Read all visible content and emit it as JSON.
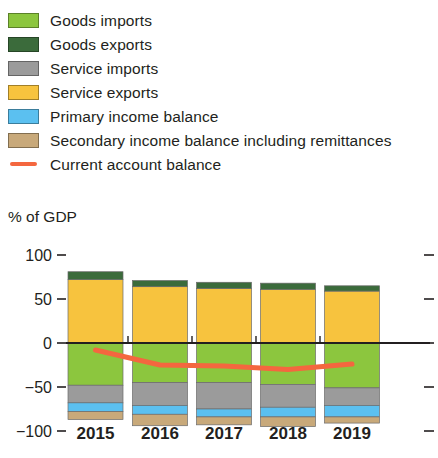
{
  "legend": {
    "items": [
      {
        "label": "Goods imports",
        "color": "#8cc63e",
        "type": "swatch",
        "name": "goods-imports"
      },
      {
        "label": "Goods exports",
        "color": "#3b6b3b",
        "type": "swatch",
        "name": "goods-exports"
      },
      {
        "label": "Service imports",
        "color": "#9b9b9b",
        "type": "swatch",
        "name": "service-imports"
      },
      {
        "label": "Service exports",
        "color": "#f7c33e",
        "type": "swatch",
        "name": "service-exports"
      },
      {
        "label": "Primary income balance",
        "color": "#5bc0f0",
        "type": "swatch",
        "name": "primary-income-balance"
      },
      {
        "label": "Secondary income balance including remittances",
        "color": "#c8a97a",
        "type": "swatch",
        "name": "secondary-income-balance"
      },
      {
        "label": "Current account balance",
        "color": "#f4673f",
        "type": "line",
        "name": "current-account-balance"
      }
    ]
  },
  "axis_title": "% of GDP",
  "chart_data": {
    "type": "bar",
    "title": "",
    "subtitle": "",
    "xlabel": "",
    "ylabel": "% of GDP",
    "ylim": [
      -100,
      100
    ],
    "yticks": [
      100,
      50,
      0,
      -50,
      -100
    ],
    "ytick_labels": [
      "100",
      "50",
      "0",
      "−50",
      "−100"
    ],
    "grid": false,
    "stacked": true,
    "legend_position": "top",
    "categories": [
      "2015",
      "2016",
      "2017",
      "2018",
      "2019"
    ],
    "series": [
      {
        "name": "Goods exports",
        "color": "#3b6b3b",
        "values": [
          9,
          7,
          7,
          7,
          6
        ]
      },
      {
        "name": "Service exports",
        "color": "#f7c33e",
        "values": [
          72,
          64,
          62,
          61,
          59
        ]
      },
      {
        "name": "Goods imports",
        "color": "#8cc63e",
        "values": [
          -48,
          -45,
          -45,
          -47,
          -51
        ]
      },
      {
        "name": "Service imports",
        "color": "#9b9b9b",
        "values": [
          -20,
          -26,
          -30,
          -26,
          -20
        ]
      },
      {
        "name": "Primary income balance",
        "color": "#5bc0f0",
        "values": [
          -10,
          -10,
          -9,
          -11,
          -13
        ]
      },
      {
        "name": "Secondary income balance including remittances",
        "color": "#c8a97a",
        "values": [
          -9,
          -13,
          -9,
          -11,
          -7
        ]
      }
    ],
    "line_series": {
      "name": "Current account balance",
      "color": "#f4673f",
      "values": [
        -8,
        -25,
        -26,
        -30,
        -24
      ]
    }
  }
}
